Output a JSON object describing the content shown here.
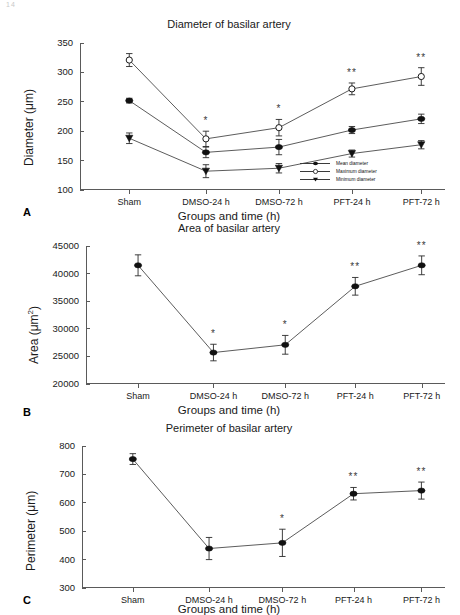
{
  "page": {
    "corner_mark": "14"
  },
  "axis_x_title": "Groups and time (h)",
  "categories": [
    "Sham",
    "DMSO-24 h",
    "DMSO-72 h",
    "PFT-24 h",
    "PFT-72 h"
  ],
  "panels": [
    {
      "letter": "A",
      "title": "Diameter of basilar artery",
      "ylabel": "Diameter (μm)"
    },
    {
      "letter": "B",
      "title": "Area of basilar artery",
      "ylabel": "Area (μm²)"
    },
    {
      "letter": "C",
      "title": "Perimeter of basilar artery",
      "ylabel": "Perimeter (μm)"
    }
  ],
  "legend": {
    "items": [
      {
        "label": "Mean diameter",
        "marker": "filled-circle"
      },
      {
        "label": "Maximum diameter",
        "marker": "open-circle"
      },
      {
        "label": "Minimum diameter",
        "marker": "filled-triangle-down"
      }
    ]
  },
  "chart_data": [
    {
      "type": "line",
      "title": "Diameter of basilar artery",
      "xlabel": "Groups and time (h)",
      "ylabel": "Diameter (μm)",
      "categories": [
        "Sham",
        "DMSO-24 h",
        "DMSO-72 h",
        "PFT-24 h",
        "PFT-72 h"
      ],
      "ylim": [
        100,
        350
      ],
      "yticks": [
        100,
        150,
        200,
        250,
        300,
        350
      ],
      "grid": false,
      "legend_position": "lower-right",
      "series": [
        {
          "name": "Maximum diameter",
          "marker": "open-circle",
          "values": [
            321,
            187,
            206,
            272,
            293
          ],
          "errors": [
            11,
            13,
            14,
            10,
            15
          ],
          "annotations": [
            "",
            "*",
            "*",
            "**",
            "**"
          ]
        },
        {
          "name": "Mean diameter",
          "marker": "filled-circle",
          "values": [
            252,
            164,
            173,
            202,
            221
          ],
          "errors": [
            4,
            9,
            13,
            6,
            8
          ],
          "annotations": [
            "",
            "",
            "",
            "",
            ""
          ]
        },
        {
          "name": "Minimum diameter",
          "marker": "filled-triangle-down",
          "values": [
            188,
            132,
            137,
            162,
            177
          ],
          "errors": [
            9,
            11,
            8,
            6,
            7
          ],
          "annotations": [
            "",
            "",
            "",
            "",
            ""
          ]
        }
      ]
    },
    {
      "type": "line",
      "title": "Area of basilar artery",
      "xlabel": "Groups and time (h)",
      "ylabel": "Area (μm²)",
      "categories": [
        "Sham",
        "DMSO-24 h",
        "DMSO-72 h",
        "PFT-24 h",
        "PFT-72 h"
      ],
      "ylim": [
        20000,
        45000
      ],
      "yticks": [
        20000,
        25000,
        30000,
        35000,
        40000,
        45000
      ],
      "grid": false,
      "legend_position": "none",
      "series": [
        {
          "name": "Area",
          "marker": "filled-circle",
          "values": [
            41500,
            25700,
            27100,
            37700,
            41500
          ],
          "errors": [
            1900,
            1500,
            1700,
            1600,
            1700
          ],
          "annotations": [
            "",
            "*",
            "*",
            "**",
            "**"
          ]
        }
      ]
    },
    {
      "type": "line",
      "title": "Perimeter of basilar artery",
      "xlabel": "Groups and time (h)",
      "ylabel": "Perimeter (μm)",
      "categories": [
        "Sham",
        "DMSO-24 h",
        "DMSO-72 h",
        "PFT-24 h",
        "PFT-72 h"
      ],
      "ylim": [
        300,
        800
      ],
      "yticks": [
        300,
        400,
        500,
        600,
        700,
        800
      ],
      "grid": false,
      "legend_position": "none",
      "series": [
        {
          "name": "Perimeter",
          "marker": "filled-circle",
          "values": [
            754,
            439,
            459,
            632,
            643
          ],
          "errors": [
            19,
            39,
            48,
            22,
            30
          ],
          "annotations": [
            "",
            "",
            "*",
            "**",
            "**"
          ]
        }
      ]
    }
  ]
}
